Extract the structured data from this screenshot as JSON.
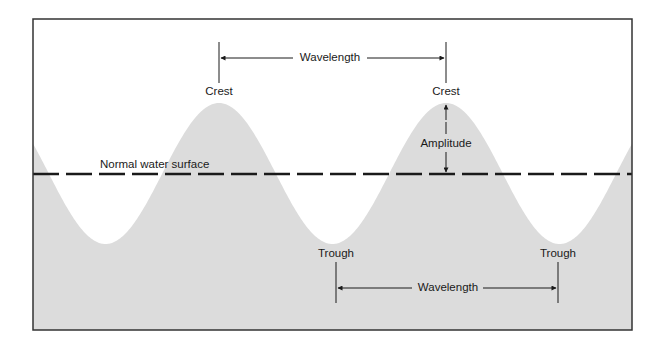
{
  "diagram": {
    "type": "wave-anatomy",
    "colors": {
      "water_fill": "#dcdcdc",
      "background": "#ffffff",
      "line": "#1a1a1a",
      "frame": "#333333"
    },
    "labels": {
      "normal_water_surface": "Normal water surface",
      "crest_left": "Crest",
      "crest_right": "Crest",
      "trough_left": "Trough",
      "trough_right": "Trough",
      "amplitude": "Amplitude",
      "wavelength_top": "Wavelength",
      "wavelength_bottom": "Wavelength"
    },
    "geometry": {
      "frame": {
        "x": 33,
        "y": 19,
        "width": 599,
        "height": 311
      },
      "still_water_level_y": 174,
      "crests_x": [
        219,
        446
      ],
      "troughs_x": [
        107,
        336,
        558
      ],
      "crest_y": 103,
      "trough_y": 244
    }
  }
}
